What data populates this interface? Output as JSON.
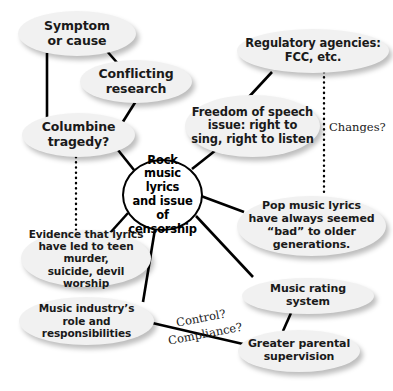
{
  "diagram": {
    "background_color": "#ffffff",
    "node_fill_color": "#f1f1f1",
    "center_fill_color": "#ffffff",
    "line_color": "#000000",
    "text_color": "#1a1a1a"
  },
  "center": {
    "id": "center",
    "label": "Rock\nmusic lyrics\nand issue of\ncensorship",
    "x": 122,
    "y": 159,
    "w": 81,
    "h": 72,
    "font_size": 11.5
  },
  "nodes": [
    {
      "id": "symptom-or-cause",
      "label": "Symptom\nor cause",
      "x": 18,
      "y": 11,
      "w": 118,
      "h": 45,
      "font_size": 12.5
    },
    {
      "id": "conflicting-research",
      "label": "Conflicting\nresearch",
      "x": 80,
      "y": 60,
      "w": 112,
      "h": 43,
      "font_size": 12.5
    },
    {
      "id": "regulatory-agencies",
      "label": "Regulatory agencies:\nFCC, etc.",
      "x": 237,
      "y": 29,
      "w": 152,
      "h": 44,
      "font_size": 11.5
    },
    {
      "id": "freedom-of-speech",
      "label": "Freedom of speech\nissue: right to\nsing, right to listen",
      "x": 185,
      "y": 95,
      "w": 135,
      "h": 62,
      "font_size": 11.5
    },
    {
      "id": "columbine-tragedy",
      "label": "Columbine\ntragedy?",
      "x": 22,
      "y": 113,
      "w": 113,
      "h": 44,
      "font_size": 12.5
    },
    {
      "id": "pop-music-lyrics",
      "label": "Pop music lyrics\nhave always seemed\n“bad” to older\ngenerations.",
      "x": 237,
      "y": 196,
      "w": 149,
      "h": 60,
      "font_size": 11
    },
    {
      "id": "evidence-that-lyrics",
      "label": "Evidence that lyrics\nhave led to teen murder,\nsuicide, devil worship",
      "x": 21,
      "y": 230,
      "w": 130,
      "h": 57,
      "font_size": 10.5
    },
    {
      "id": "music-rating-system",
      "label": "Music rating system",
      "x": 242,
      "y": 278,
      "w": 132,
      "h": 36,
      "font_size": 11
    },
    {
      "id": "music-industry-role",
      "label": "Music industry’s\nrole and responsibilities",
      "x": 19,
      "y": 297,
      "w": 135,
      "h": 48,
      "font_size": 10.5
    },
    {
      "id": "greater-parental-supervision",
      "label": "Greater parental\nsupervision",
      "x": 238,
      "y": 330,
      "w": 122,
      "h": 42,
      "font_size": 11
    }
  ],
  "edge_labels": [
    {
      "id": "changes",
      "text": "Changes?",
      "x": 329,
      "y": 120,
      "rotate": 0
    },
    {
      "id": "control",
      "text": "Control?",
      "x": 175,
      "y": 316,
      "rotate": -11
    },
    {
      "id": "compliance",
      "text": "Compliance?",
      "x": 167,
      "y": 334,
      "rotate": -11
    }
  ],
  "edges": [
    {
      "id": "symptom-to-columbine",
      "style": "solid",
      "width": 2.6,
      "x1": 47,
      "y1": 53,
      "x2": 47,
      "y2": 126
    },
    {
      "id": "symptom-to-conflicting",
      "style": "solid",
      "width": 2.6,
      "x1": 106,
      "y1": 50,
      "x2": 120,
      "y2": 66
    },
    {
      "id": "conflicting-to-center",
      "style": "solid",
      "width": 2.6,
      "x1": 136,
      "y1": 101,
      "x2": 119,
      "y2": 128
    },
    {
      "id": "regulatory-to-freedom",
      "style": "solid",
      "width": 2.6,
      "x1": 272,
      "y1": 72,
      "x2": 247,
      "y2": 99
    },
    {
      "id": "regulatory-to-pop-dotted",
      "style": "dotted",
      "width": 2.4,
      "x1": 324,
      "y1": 72,
      "x2": 324,
      "y2": 196
    },
    {
      "id": "columbine-to-evidence-dotted",
      "style": "dotted",
      "width": 2.4,
      "x1": 76,
      "y1": 157,
      "x2": 76,
      "y2": 232
    },
    {
      "id": "center-to-columbine",
      "style": "solid",
      "width": 2.6,
      "x1": 134,
      "y1": 170,
      "x2": 118,
      "y2": 150
    },
    {
      "id": "center-to-freedom",
      "style": "solid",
      "width": 2.6,
      "x1": 192,
      "y1": 169,
      "x2": 216,
      "y2": 150
    },
    {
      "id": "center-to-pop",
      "style": "solid",
      "width": 2.6,
      "x1": 201,
      "y1": 196,
      "x2": 244,
      "y2": 212
    },
    {
      "id": "center-to-rating",
      "style": "solid",
      "width": 2.6,
      "x1": 196,
      "y1": 216,
      "x2": 253,
      "y2": 277
    },
    {
      "id": "center-to-evidence",
      "style": "solid",
      "width": 2.6,
      "x1": 128,
      "y1": 213,
      "x2": 110,
      "y2": 233
    },
    {
      "id": "center-to-industry",
      "style": "solid",
      "width": 2.6,
      "x1": 155,
      "y1": 229,
      "x2": 143,
      "y2": 302
    },
    {
      "id": "rating-to-supervision",
      "style": "solid",
      "width": 2.6,
      "x1": 291,
      "y1": 313,
      "x2": 283,
      "y2": 331
    },
    {
      "id": "industry-to-supervision",
      "style": "solid",
      "width": 2.6,
      "x1": 148,
      "y1": 322,
      "x2": 243,
      "y2": 344
    }
  ]
}
